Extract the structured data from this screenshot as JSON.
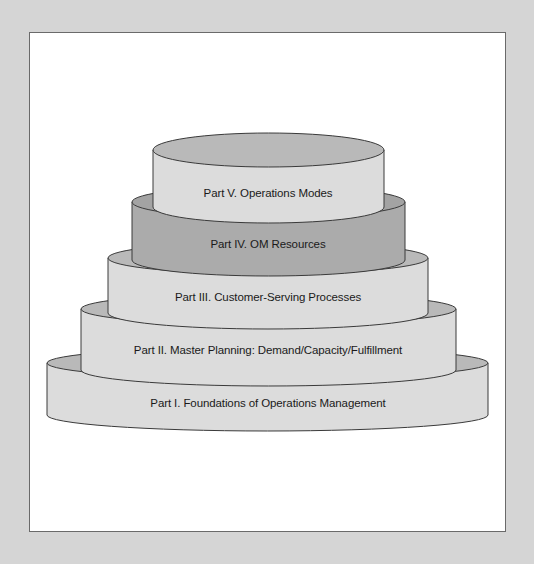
{
  "diagram": {
    "type": "stacked-cylinder-pyramid",
    "tiers": [
      {
        "level": 5,
        "label": "Part V. Operations Modes",
        "fill_side": "#dcdcdc",
        "fill_top": "#b9b9b9"
      },
      {
        "level": 4,
        "label": "Part IV. OM Resources",
        "fill_side": "#ababab",
        "fill_top": "#a3a3a3"
      },
      {
        "level": 3,
        "label": "Part III. Customer-Serving Processes",
        "fill_side": "#dcdcdc",
        "fill_top": "#b9b9b9"
      },
      {
        "level": 2,
        "label": "Part II. Master Planning: Demand/Capacity/Fulfillment",
        "fill_side": "#dcdcdc",
        "fill_top": "#b9b9b9"
      },
      {
        "level": 1,
        "label": "Part I. Foundations of Operations Management",
        "fill_side": "#dcdcdc",
        "fill_top": "#b9b9b9"
      }
    ]
  },
  "colors": {
    "background": "#d5d5d5",
    "frame": "#ffffff",
    "outline": "#3a3a3a"
  }
}
